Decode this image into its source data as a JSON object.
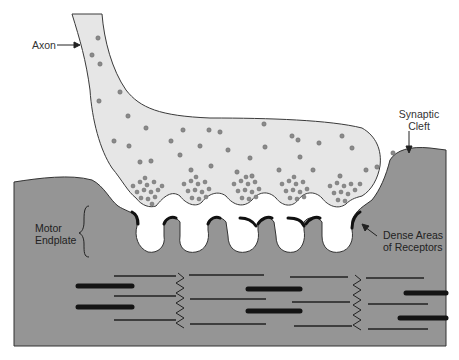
{
  "labels": {
    "axon": "Axon",
    "synaptic_cleft_1": "Synaptic",
    "synaptic_cleft_2": "Cleft",
    "motor_endplate_1": "Motor",
    "motor_endplate_2": "Endplate",
    "dense_areas_1": "Dense Areas",
    "dense_areas_2": "of Receptors"
  },
  "colors": {
    "terminal_fill": "#e6e6e6",
    "muscle_fill": "#959595",
    "vesicle": "#8a8a8a",
    "filament": "#1a1a1a",
    "outline": "#3a3a3a"
  }
}
